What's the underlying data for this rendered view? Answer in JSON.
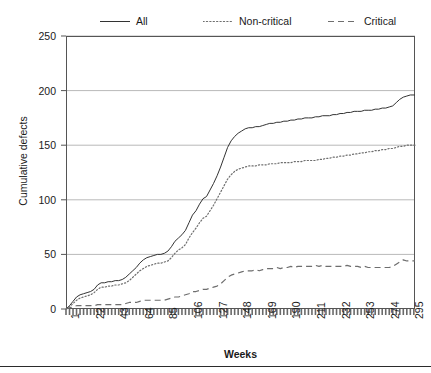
{
  "chart_data": {
    "type": "line",
    "title": "",
    "xlabel": "Weeks",
    "ylabel": "Cumulative defects",
    "xlim": [
      1,
      299
    ],
    "ylim": [
      0,
      250
    ],
    "yticks": [
      0,
      50,
      100,
      150,
      200,
      250
    ],
    "xticks": [
      1,
      22,
      43,
      64,
      85,
      106,
      127,
      148,
      169,
      190,
      211,
      232,
      253,
      274,
      295
    ],
    "grid": "horizontal",
    "legend_position": "above-plot",
    "series": [
      {
        "name": "All",
        "style": "solid",
        "color": "#333333",
        "x": [
          1,
          4,
          7,
          10,
          13,
          16,
          19,
          22,
          25,
          28,
          31,
          34,
          37,
          40,
          43,
          46,
          49,
          52,
          55,
          58,
          61,
          64,
          67,
          70,
          73,
          76,
          79,
          82,
          85,
          88,
          91,
          94,
          97,
          100,
          103,
          106,
          109,
          112,
          115,
          118,
          121,
          124,
          127,
          130,
          133,
          136,
          139,
          142,
          145,
          148,
          151,
          154,
          157,
          160,
          163,
          166,
          169,
          172,
          175,
          178,
          181,
          184,
          187,
          190,
          193,
          196,
          199,
          202,
          205,
          208,
          211,
          214,
          217,
          220,
          223,
          226,
          229,
          232,
          235,
          238,
          241,
          244,
          247,
          250,
          253,
          256,
          259,
          262,
          265,
          268,
          271,
          274,
          277,
          280,
          283,
          286,
          289,
          292,
          295,
          299
        ],
        "y": [
          0,
          3,
          7,
          11,
          13,
          14,
          15,
          16,
          18,
          22,
          24,
          24,
          25,
          25,
          26,
          26,
          27,
          29,
          32,
          35,
          38,
          42,
          45,
          47,
          48,
          49,
          50,
          50,
          51,
          53,
          57,
          62,
          65,
          68,
          72,
          79,
          86,
          90,
          96,
          101,
          103,
          109,
          115,
          122,
          130,
          139,
          148,
          154,
          158,
          161,
          163,
          165,
          166,
          166,
          167,
          167,
          168,
          169,
          170,
          170,
          171,
          171,
          172,
          172,
          173,
          173,
          174,
          174,
          175,
          175,
          175,
          176,
          176,
          177,
          177,
          177,
          178,
          178,
          179,
          179,
          180,
          180,
          181,
          181,
          181,
          182,
          182,
          182,
          183,
          183,
          184,
          184,
          185,
          186,
          189,
          192,
          194,
          195,
          196,
          196
        ]
      },
      {
        "name": "Non-critical",
        "style": "dotted",
        "color": "#6e6e6e",
        "x": [
          1,
          4,
          7,
          10,
          13,
          16,
          19,
          22,
          25,
          28,
          31,
          34,
          37,
          40,
          43,
          46,
          49,
          52,
          55,
          58,
          61,
          64,
          67,
          70,
          73,
          76,
          79,
          82,
          85,
          88,
          91,
          94,
          97,
          100,
          103,
          106,
          109,
          112,
          115,
          118,
          121,
          124,
          127,
          130,
          133,
          136,
          139,
          142,
          145,
          148,
          151,
          154,
          157,
          160,
          163,
          166,
          169,
          172,
          175,
          178,
          181,
          184,
          187,
          190,
          193,
          196,
          199,
          202,
          205,
          208,
          211,
          214,
          217,
          220,
          223,
          226,
          229,
          232,
          235,
          238,
          241,
          244,
          247,
          250,
          253,
          256,
          259,
          262,
          265,
          268,
          271,
          274,
          277,
          280,
          283,
          286,
          289,
          292,
          295,
          299
        ],
        "y": [
          0,
          2,
          5,
          8,
          10,
          11,
          12,
          13,
          15,
          18,
          20,
          20,
          21,
          21,
          22,
          22,
          23,
          24,
          26,
          29,
          32,
          35,
          37,
          39,
          40,
          41,
          42,
          42,
          43,
          44,
          47,
          51,
          54,
          56,
          59,
          65,
          70,
          74,
          79,
          83,
          85,
          90,
          95,
          101,
          107,
          113,
          119,
          123,
          126,
          128,
          129,
          130,
          131,
          131,
          131,
          132,
          132,
          132,
          133,
          133,
          133,
          134,
          134,
          134,
          134,
          135,
          135,
          135,
          136,
          136,
          136,
          136,
          137,
          137,
          138,
          138,
          139,
          139,
          140,
          140,
          141,
          141,
          142,
          142,
          143,
          143,
          144,
          144,
          145,
          145,
          146,
          146,
          147,
          147,
          148,
          149,
          149,
          150,
          150,
          150
        ]
      },
      {
        "name": "Critical",
        "style": "dashed",
        "color": "#6e6e6e",
        "x": [
          1,
          4,
          7,
          10,
          13,
          16,
          19,
          22,
          25,
          28,
          31,
          34,
          37,
          40,
          43,
          46,
          49,
          52,
          55,
          58,
          61,
          64,
          67,
          70,
          73,
          76,
          79,
          82,
          85,
          88,
          91,
          94,
          97,
          100,
          103,
          106,
          109,
          112,
          115,
          118,
          121,
          124,
          127,
          130,
          133,
          136,
          139,
          142,
          145,
          148,
          151,
          154,
          157,
          160,
          163,
          166,
          169,
          172,
          175,
          178,
          181,
          184,
          187,
          190,
          193,
          196,
          199,
          202,
          205,
          208,
          211,
          214,
          217,
          220,
          223,
          226,
          229,
          232,
          235,
          238,
          241,
          244,
          247,
          250,
          253,
          256,
          259,
          262,
          265,
          268,
          271,
          274,
          277,
          280,
          283,
          286,
          289,
          292,
          295,
          299
        ],
        "y": [
          0,
          1,
          2,
          3,
          3,
          3,
          3,
          3,
          3,
          4,
          4,
          4,
          4,
          4,
          4,
          4,
          4,
          5,
          6,
          6,
          6,
          7,
          8,
          8,
          8,
          8,
          8,
          8,
          8,
          9,
          10,
          11,
          11,
          12,
          13,
          14,
          16,
          16,
          17,
          18,
          18,
          19,
          20,
          21,
          23,
          26,
          29,
          31,
          32,
          33,
          34,
          35,
          35,
          35,
          36,
          35,
          36,
          37,
          37,
          37,
          38,
          37,
          38,
          38,
          39,
          38,
          39,
          39,
          39,
          39,
          39,
          40,
          39,
          40,
          39,
          39,
          39,
          39,
          39,
          39,
          40,
          39,
          39,
          39,
          38,
          39,
          38,
          38,
          38,
          38,
          38,
          38,
          38,
          39,
          41,
          43,
          45,
          44,
          44,
          44
        ]
      }
    ]
  },
  "legend": {
    "items": [
      {
        "label": "All",
        "style": "solid"
      },
      {
        "label": "Non-critical",
        "style": "dotted"
      },
      {
        "label": "Critical",
        "style": "dashed"
      }
    ]
  }
}
